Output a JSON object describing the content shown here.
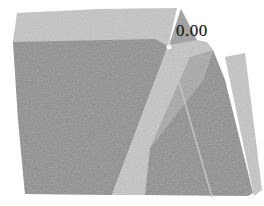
{
  "canvas": {
    "width": 264,
    "height": 206,
    "background": "#ffffff"
  },
  "chart_data": {
    "type": "surface",
    "title": "",
    "xlabel": "",
    "ylabel": "",
    "grid": false,
    "legend": false,
    "annotations": [
      {
        "text": "0.00",
        "x": 176,
        "y": 22
      }
    ],
    "colors": {
      "light": "#c6c6c6",
      "dark": "#8d8d8d",
      "medium": "#a7a7a7",
      "apex": "#9c9c9c",
      "seam": "#c4c4c4",
      "marker": "#ffffff",
      "label": "#1a1a1a",
      "background": "#ffffff"
    },
    "regions": [
      {
        "name": "top-ridge-facet",
        "fill": "light",
        "points": [
          [
            17,
            13
          ],
          [
            100,
            9
          ],
          [
            177,
            8
          ],
          [
            168,
            46
          ],
          [
            13,
            42
          ]
        ]
      },
      {
        "name": "left-front-facet",
        "fill": "dark",
        "points": [
          [
            13,
            42
          ],
          [
            155,
            39
          ],
          [
            168,
            46
          ],
          [
            112,
            195
          ],
          [
            25,
            194
          ],
          [
            18,
            120
          ]
        ]
      },
      {
        "name": "central-side-facet",
        "fill": "light",
        "points": [
          [
            168,
            46
          ],
          [
            186,
            38
          ],
          [
            207,
            42
          ],
          [
            213,
            50
          ],
          [
            150,
            195
          ],
          [
            112,
            195
          ]
        ]
      },
      {
        "name": "mid-wedge-facet",
        "fill": "medium",
        "points": [
          [
            190,
            57
          ],
          [
            213,
            50
          ],
          [
            203,
            80
          ],
          [
            150,
            148
          ]
        ]
      },
      {
        "name": "right-side-facet",
        "fill": "light",
        "points": [
          [
            225,
            57
          ],
          [
            245,
            53
          ],
          [
            262,
            190
          ],
          [
            254,
            196
          ]
        ]
      },
      {
        "name": "right-front-facet",
        "fill": "dark",
        "points": [
          [
            213,
            50
          ],
          [
            225,
            80
          ],
          [
            253,
            193
          ],
          [
            248,
            196
          ],
          [
            145,
            195
          ],
          [
            150,
            148
          ],
          [
            203,
            80
          ]
        ]
      },
      {
        "name": "apex-facet",
        "fill": "apex",
        "points": [
          [
            181,
            9
          ],
          [
            169,
            45
          ],
          [
            197,
            40
          ]
        ]
      }
    ],
    "seam_line": {
      "x1": 169,
      "y1": 47,
      "x2": 212,
      "y2": 197,
      "width": 1.6
    },
    "marker_dot": {
      "x": 169,
      "y": 47,
      "r": 2.6
    }
  }
}
